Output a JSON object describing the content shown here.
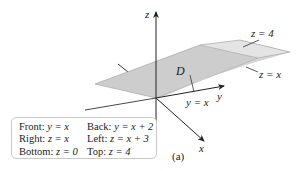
{
  "figure": {
    "panel_label": "(a)",
    "axes": {
      "z_label": "z",
      "y_label": "y",
      "x_label": "x"
    },
    "region_label": "D",
    "annotations": {
      "top_plane": "z = 4",
      "right_plane": "z = x",
      "front_plane": "y = x"
    },
    "legend": {
      "rows": [
        [
          {
            "key": "Front:",
            "eq": "y = x"
          },
          {
            "key": "Back:",
            "eq": "y = x + 2"
          }
        ],
        [
          {
            "key": "Right:",
            "eq": "z = x"
          },
          {
            "key": "Left:",
            "eq": "z = x + 3"
          }
        ],
        [
          {
            "key": "Bottom:",
            "eq": "z = 0"
          },
          {
            "key": "Top:",
            "eq": "z = 4"
          }
        ]
      ]
    },
    "colors": {
      "axis": "#333333",
      "solid_face_dark": "#bdbdbd",
      "solid_face_mid": "#cfcfcf",
      "solid_face_light": "#e2e2e2",
      "legend_border": "#c9c9c9"
    }
  }
}
